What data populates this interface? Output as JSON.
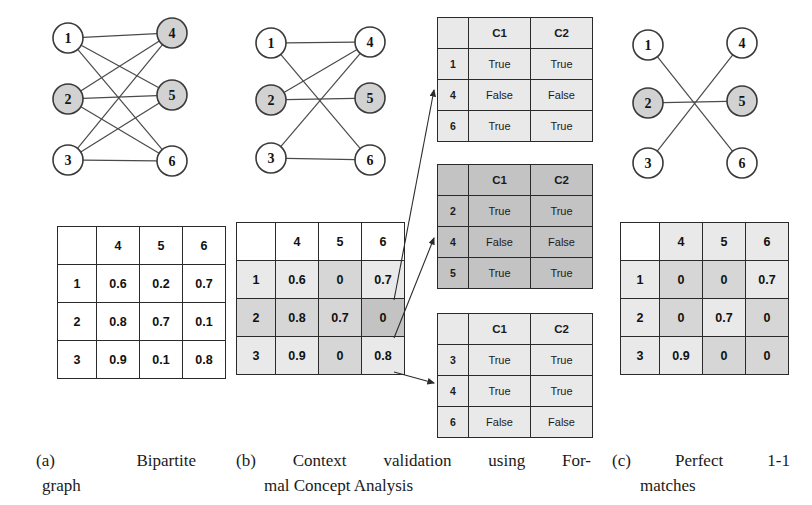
{
  "panels": {
    "a": {
      "caption_label": "(a)",
      "caption_word1": "Bipartite",
      "caption_word2": "graph",
      "graph": {
        "name": "bipartite-graph-complete",
        "left_nodes": [
          {
            "label": "1",
            "fill": "white",
            "cx": 68,
            "cy": 38
          },
          {
            "label": "2",
            "fill": "gray",
            "cx": 68,
            "cy": 99
          },
          {
            "label": "3",
            "fill": "white",
            "cx": 68,
            "cy": 160
          }
        ],
        "right_nodes": [
          {
            "label": "4",
            "fill": "gray",
            "cx": 172,
            "cy": 33
          },
          {
            "label": "5",
            "fill": "gray",
            "cx": 172,
            "cy": 95
          },
          {
            "label": "6",
            "fill": "white",
            "cx": 172,
            "cy": 161
          }
        ],
        "edges": [
          [
            "1",
            "4"
          ],
          [
            "1",
            "5"
          ],
          [
            "1",
            "6"
          ],
          [
            "2",
            "4"
          ],
          [
            "2",
            "5"
          ],
          [
            "2",
            "6"
          ],
          [
            "3",
            "4"
          ],
          [
            "3",
            "5"
          ],
          [
            "3",
            "6"
          ]
        ]
      },
      "matrix": {
        "name": "similarity-matrix-full",
        "corner": "",
        "columns": [
          "4",
          "5",
          "6"
        ],
        "rows": [
          {
            "header": "1",
            "values": [
              "0.6",
              "0.2",
              "0.7"
            ],
            "shades": [
              "none",
              "none",
              "none"
            ]
          },
          {
            "header": "2",
            "values": [
              "0.8",
              "0.7",
              "0.1"
            ],
            "shades": [
              "none",
              "none",
              "none"
            ]
          },
          {
            "header": "3",
            "values": [
              "0.9",
              "0.1",
              "0.8"
            ],
            "shades": [
              "none",
              "none",
              "none"
            ]
          }
        ],
        "row_header_shades": [
          "none",
          "none",
          "none"
        ],
        "col_header_shades": [
          "none",
          "none",
          "none"
        ]
      }
    },
    "b": {
      "caption_label": "(b)",
      "caption_word1": "Context",
      "caption_word2": "validation",
      "caption_word3": "using",
      "caption_word4": "For-",
      "caption_line2": "mal Concept Analysis",
      "graph": {
        "name": "bipartite-graph-pruned",
        "left_nodes": [
          {
            "label": "1",
            "fill": "white",
            "cx": 271,
            "cy": 43
          },
          {
            "label": "2",
            "fill": "gray",
            "cx": 271,
            "cy": 100
          },
          {
            "label": "3",
            "fill": "white",
            "cx": 271,
            "cy": 158
          }
        ],
        "right_nodes": [
          {
            "label": "4",
            "fill": "white",
            "cx": 370,
            "cy": 42
          },
          {
            "label": "5",
            "fill": "gray",
            "cx": 370,
            "cy": 98
          },
          {
            "label": "6",
            "fill": "white",
            "cx": 370,
            "cy": 160
          }
        ],
        "edges": [
          [
            "1",
            "4"
          ],
          [
            "1",
            "6"
          ],
          [
            "2",
            "4"
          ],
          [
            "2",
            "5"
          ],
          [
            "3",
            "4"
          ],
          [
            "3",
            "6"
          ]
        ]
      },
      "matrix": {
        "name": "similarity-matrix-thresholded",
        "corner": "",
        "columns": [
          "4",
          "5",
          "6"
        ],
        "rows": [
          {
            "header": "1",
            "values": [
              "0.6",
              "0",
              "0.7"
            ],
            "shades": [
              "light",
              "mid",
              "light"
            ]
          },
          {
            "header": "2",
            "values": [
              "0.8",
              "0.7",
              "0"
            ],
            "shades": [
              "mid",
              "mid",
              "dark"
            ]
          },
          {
            "header": "3",
            "values": [
              "0.9",
              "0",
              "0.8"
            ],
            "shades": [
              "light",
              "mid",
              "light"
            ]
          }
        ],
        "row_header_shades": [
          "light",
          "mid",
          "light"
        ],
        "col_header_shades": [
          "none",
          "none",
          "none"
        ]
      },
      "concept_tables": [
        {
          "name": "concept-table-1",
          "shade": "light",
          "corner": "",
          "columns": [
            "C1",
            "C2"
          ],
          "rows": [
            {
              "header": "1",
              "values": [
                "True",
                "True"
              ]
            },
            {
              "header": "4",
              "values": [
                "False",
                "False"
              ]
            },
            {
              "header": "6",
              "values": [
                "True",
                "True"
              ]
            }
          ]
        },
        {
          "name": "concept-table-2",
          "shade": "dark",
          "corner": "",
          "columns": [
            "C1",
            "C2"
          ],
          "rows": [
            {
              "header": "2",
              "values": [
                "True",
                "True"
              ]
            },
            {
              "header": "4",
              "values": [
                "False",
                "False"
              ]
            },
            {
              "header": "5",
              "values": [
                "True",
                "True"
              ]
            }
          ]
        },
        {
          "name": "concept-table-3",
          "shade": "light",
          "corner": "",
          "columns": [
            "C1",
            "C2"
          ],
          "rows": [
            {
              "header": "3",
              "values": [
                "True",
                "True"
              ]
            },
            {
              "header": "4",
              "values": [
                "True",
                "True"
              ]
            },
            {
              "header": "6",
              "values": [
                "False",
                "False"
              ]
            }
          ]
        }
      ]
    },
    "c": {
      "caption_label": "(c)",
      "caption_word1": "Perfect",
      "caption_word2": "1-1",
      "caption_line2": "matches",
      "graph": {
        "name": "bipartite-graph-matching",
        "left_nodes": [
          {
            "label": "1",
            "fill": "white",
            "cx": 648,
            "cy": 45
          },
          {
            "label": "2",
            "fill": "gray",
            "cx": 648,
            "cy": 103
          },
          {
            "label": "3",
            "fill": "white",
            "cx": 648,
            "cy": 163
          }
        ],
        "right_nodes": [
          {
            "label": "4",
            "fill": "white",
            "cx": 742,
            "cy": 43
          },
          {
            "label": "5",
            "fill": "gray",
            "cx": 742,
            "cy": 101
          },
          {
            "label": "6",
            "fill": "white",
            "cx": 742,
            "cy": 163
          }
        ],
        "edges": [
          [
            "1",
            "6"
          ],
          [
            "2",
            "5"
          ],
          [
            "3",
            "4"
          ]
        ]
      },
      "matrix": {
        "name": "similarity-matrix-matched",
        "corner": "",
        "columns": [
          "4",
          "5",
          "6"
        ],
        "rows": [
          {
            "header": "1",
            "values": [
              "0",
              "0",
              "0.7"
            ],
            "shades": [
              "mid",
              "mid",
              "light"
            ]
          },
          {
            "header": "2",
            "values": [
              "0",
              "0.7",
              "0"
            ],
            "shades": [
              "mid",
              "light",
              "mid"
            ]
          },
          {
            "header": "3",
            "values": [
              "0.9",
              "0",
              "0"
            ],
            "shades": [
              "light",
              "mid",
              "mid"
            ]
          }
        ],
        "row_header_shades": [
          "light",
          "light",
          "light"
        ],
        "col_header_shades": [
          "light",
          "light",
          "light"
        ]
      }
    }
  },
  "colors": {
    "node_fill_gray": "#d2d2d2",
    "node_fill_white": "#ffffff",
    "node_stroke": "#3a3a3a",
    "edge_stroke": "#4a4a4a",
    "arrow_stroke": "#2b2b2b",
    "table_border": "#1c1c1c",
    "shade_light": "#e9e9e9",
    "shade_mid": "#d6d6d6",
    "shade_dark": "#c3c3c3"
  },
  "arrows": [
    {
      "name": "arrow-row1-to-concept1",
      "x1": 394,
      "y1": 300,
      "x2": 434,
      "y2": 90
    },
    {
      "name": "arrow-row2-to-concept2",
      "x1": 394,
      "y1": 338,
      "x2": 434,
      "y2": 238
    },
    {
      "name": "arrow-row3-to-concept3",
      "x1": 394,
      "y1": 372,
      "x2": 434,
      "y2": 383
    }
  ]
}
